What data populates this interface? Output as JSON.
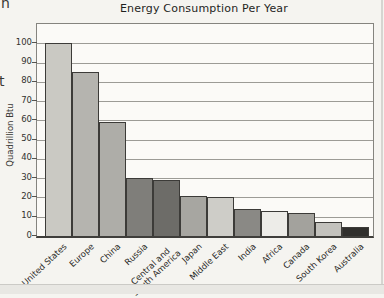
{
  "page": {
    "cropped_text_top_left": "n",
    "cropped_text_mid_left": "t"
  },
  "chart_data": {
    "type": "bar",
    "title": "Energy Consumption Per Year",
    "xlabel": "",
    "ylabel": "Quadrillion Btu",
    "ylim": [
      0,
      110
    ],
    "yticks": [
      0,
      10,
      20,
      30,
      40,
      50,
      60,
      70,
      80,
      90,
      100
    ],
    "grid": true,
    "legend": false,
    "categories": [
      "United States",
      "Europe",
      "China",
      "Russia",
      "Central and\nSouth America",
      "Japan",
      "Middle East",
      "India",
      "Africa",
      "Canada",
      "South Korea",
      "Australia"
    ],
    "values": [
      100,
      85,
      59,
      30,
      29,
      21,
      20,
      14,
      13,
      12,
      7.5,
      4.5
    ],
    "bar_colors": [
      "#cac9c3",
      "#b5b4af",
      "#aeada8",
      "#7f7e7a",
      "#6d6c68",
      "#a7a6a1",
      "#cecdc8",
      "#8a8985",
      "#edece8",
      "#a3a29d",
      "#c3c2bd",
      "#302f2d"
    ]
  }
}
